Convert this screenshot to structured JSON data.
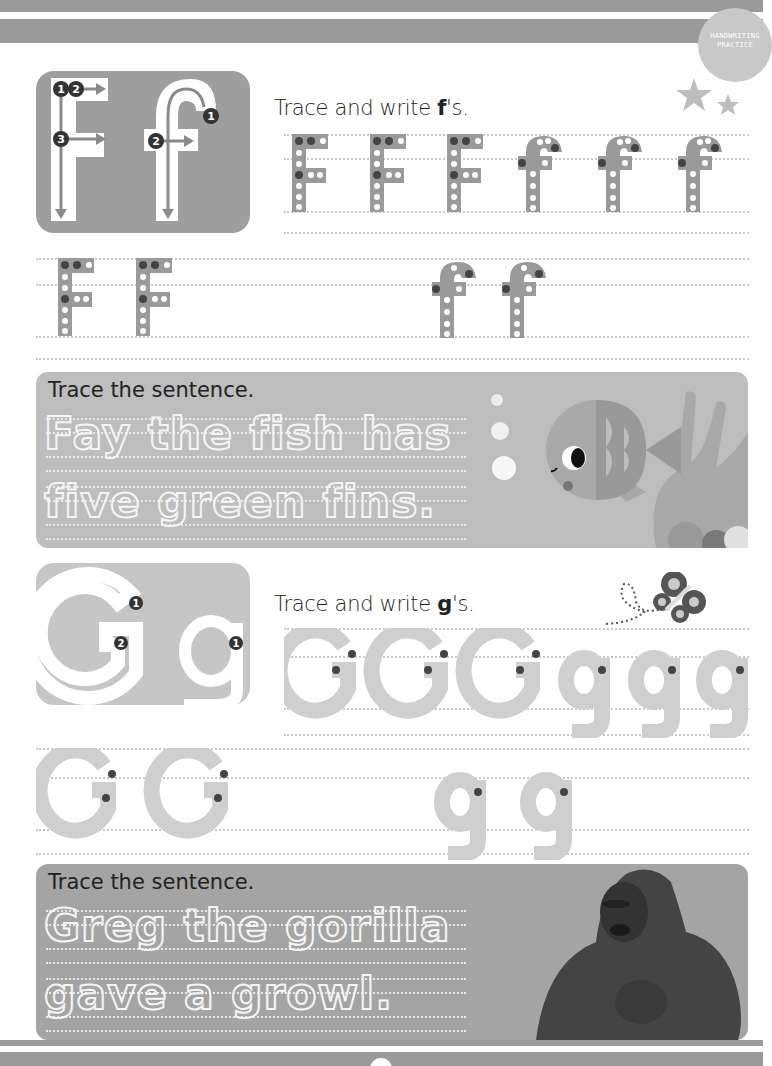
{
  "header": {
    "badge_line1": "HANDWRITING",
    "badge_line2": "PRACTICE"
  },
  "colors": {
    "band": "#9a9a9a",
    "card_f": "#9e9e9e",
    "card_g": "#c6c6c6",
    "box_f": "#bdbdbd",
    "box_g": "#a4a4a4",
    "dot_dark": "#444444"
  },
  "section_f": {
    "card_letters": "Ff",
    "stroke_numbers": [
      "1",
      "2",
      "3",
      "1",
      "2"
    ],
    "prompt_before": "Trace and write ",
    "prompt_bold": "f",
    "prompt_after": "'s.",
    "row1_letters": [
      "F",
      "F",
      "F",
      "f",
      "f",
      "f"
    ],
    "row2_letters": [
      "F",
      "F",
      "f",
      "f"
    ],
    "decoration": "stars-icon",
    "sentence_title": "Trace the sentence.",
    "sentence_line1": "Fay the fish has",
    "sentence_line2": "five green fins.",
    "illustration": "fish-and-coral"
  },
  "section_g": {
    "card_letters": "Gg",
    "stroke_numbers": [
      "1",
      "2",
      "1"
    ],
    "prompt_before": "Trace and write ",
    "prompt_bold": "g",
    "prompt_after": "'s.",
    "row1_letters": [
      "G",
      "G",
      "G",
      "g",
      "g",
      "g"
    ],
    "row2_letters": [
      "G",
      "G",
      "g",
      "g"
    ],
    "decoration": "butterfly-icon",
    "sentence_title": "Trace the sentence.",
    "sentence_line1": "Greg the gorilla",
    "sentence_line2": "gave a growl.",
    "illustration": "gorilla-photo"
  }
}
